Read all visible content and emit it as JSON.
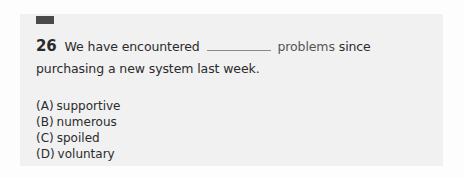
{
  "question": {
    "number": "26",
    "text_before": "We have encountered",
    "blank": "",
    "keyword": "problems",
    "text_after": "since purchasing a new system last week."
  },
  "options": [
    {
      "letter": "(A)",
      "text": "supportive"
    },
    {
      "letter": "(B)",
      "text": "numerous"
    },
    {
      "letter": "(C)",
      "text": "spoiled"
    },
    {
      "letter": "(D)",
      "text": "voluntary"
    }
  ],
  "colors": {
    "card_background": "#f1f1f1",
    "marker": "#4a4a4a",
    "text": "#2b2b2b",
    "keyword": "#555555"
  }
}
